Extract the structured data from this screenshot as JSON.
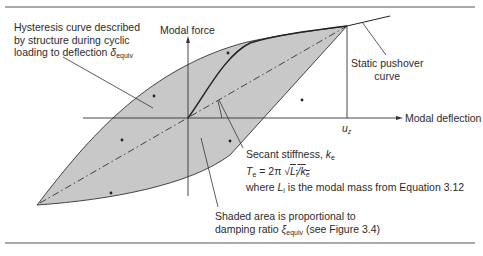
{
  "axes": {
    "y_label": "Modal force",
    "x_label": "Modal deflection",
    "x_marker": "u",
    "x_marker_sub": "z"
  },
  "annotations": {
    "hysteresis": {
      "line1": "Hysteresis curve described",
      "line2": "by structure during cyclic",
      "line3": "loading to deflection ",
      "symbol": "δ",
      "symbol_sub": "equiv"
    },
    "pushover": {
      "line1": "Static pushover",
      "line2": "curve"
    },
    "secant": {
      "line1": "Secant stiffness, ",
      "k": "k",
      "k_sub": "e",
      "t": "T",
      "t_sub": "e",
      "eq": " = 2π √",
      "L": "L",
      "L_sub": "i",
      "slash": "/",
      "k2": "k",
      "k2_sub": "e",
      "line3a": "where ",
      "line3L": "L",
      "line3L_sub": "i",
      "line3b": " is the modal mass from Equation 3.12"
    },
    "shaded": {
      "line1": "Shaded area is proportional to",
      "line2a": "damping ratio ",
      "xi": "ξ",
      "xi_sub": "equiv",
      "line2b": " (see Figure 3.4)"
    }
  },
  "colors": {
    "fill": "#c8c8c8",
    "stroke": "#2e2e2e",
    "rule": "#555555"
  }
}
